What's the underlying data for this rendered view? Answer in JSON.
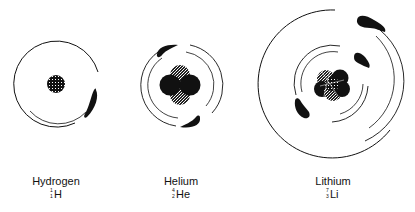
{
  "atoms": [
    {
      "name": "Hydrogen",
      "symbol": "H",
      "mass_number": "1",
      "atomic_number": "1",
      "electrons": 1,
      "center": [
        56,
        84
      ]
    },
    {
      "name": "Helium",
      "symbol": "He",
      "mass_number": "4",
      "atomic_number": "2",
      "electrons": 2,
      "center": [
        180,
        85
      ]
    },
    {
      "name": "Lithium",
      "symbol": "Li",
      "mass_number": "7",
      "atomic_number": "3",
      "electrons": 3,
      "center": [
        333,
        84
      ]
    }
  ],
  "colors": {
    "ink": "#111111",
    "background": "#ffffff"
  }
}
